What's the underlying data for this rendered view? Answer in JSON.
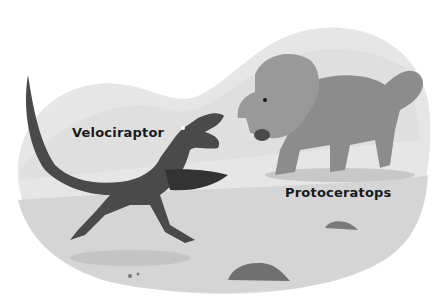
{
  "illustration": {
    "style": "grayscale children's book illustration",
    "background_color": "#ffffff",
    "ground_color": "#d9d9d9",
    "labels": {
      "velociraptor": "Velociraptor",
      "protoceratops": "Protoceratops"
    },
    "subjects": [
      {
        "name": "Velociraptor",
        "description": "feathered striped raptor leaping, mouth open, wings spread",
        "color": "#4a4a4a"
      },
      {
        "name": "Protoceratops",
        "description": "frilled beaked dinosaur with spotted back, growling",
        "color": "#8a8a8a"
      }
    ],
    "details": [
      "desert ground",
      "rocks",
      "hills in background"
    ]
  }
}
